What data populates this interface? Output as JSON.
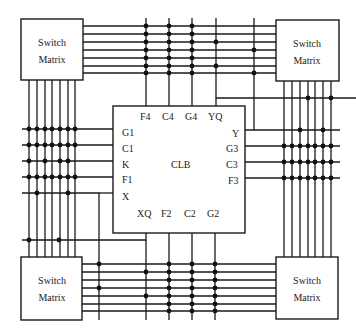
{
  "diagram": {
    "center_block": {
      "label": "CLB"
    },
    "switch_matrices": [
      {
        "id": "top-left",
        "line1": "Switch",
        "line2": "Matrix"
      },
      {
        "id": "top-right",
        "line1": "Switch",
        "line2": "Matrix"
      },
      {
        "id": "bottom-left",
        "line1": "Switch",
        "line2": "Matrix"
      },
      {
        "id": "bottom-right",
        "line1": "Switch",
        "line2": "Matrix"
      }
    ],
    "pins": {
      "top": [
        "F4",
        "C4",
        "G4",
        "YQ"
      ],
      "left": [
        "G1",
        "C1",
        "K",
        "F1",
        "X"
      ],
      "right": [
        "Y",
        "G3",
        "C3",
        "F3"
      ],
      "bottom": [
        "XQ",
        "F2",
        "C2",
        "G2"
      ]
    },
    "channel_wire_count": 7,
    "colors": {
      "line": "#1a1a1a",
      "background": "#ffffff"
    }
  }
}
